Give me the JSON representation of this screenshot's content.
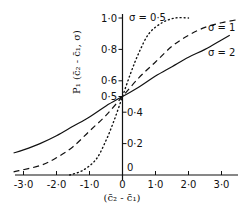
{
  "chart_data": {
    "type": "line",
    "title": "",
    "xlabel": "(c̄₂ - c̄₁)",
    "ylabel": "P₁ (c̄₂ - c̄₁, σ)",
    "xlim": [
      -3.3,
      3.5
    ],
    "ylim": [
      0,
      1.0
    ],
    "grid": false,
    "x_ticks": [
      {
        "value": -3.0,
        "label": "-3·0"
      },
      {
        "value": -2.0,
        "label": "-2·0"
      },
      {
        "value": -1.0,
        "label": "-1·0"
      },
      {
        "value": 0,
        "label": "0"
      },
      {
        "value": 1.0,
        "label": "1·0"
      },
      {
        "value": 2.0,
        "label": "2·0"
      },
      {
        "value": 3.0,
        "label": "3·0"
      }
    ],
    "y_ticks": [
      {
        "value": 0,
        "label": "0",
        "side": "right"
      },
      {
        "value": 0.2,
        "label": "0·2",
        "side": "right"
      },
      {
        "value": 0.4,
        "label": "0·4",
        "side": "right"
      },
      {
        "value": 0.5,
        "label": "0·5",
        "side": "left"
      },
      {
        "value": 0.6,
        "label": "0·6",
        "side": "left"
      },
      {
        "value": 0.8,
        "label": "0·8",
        "side": "left"
      },
      {
        "value": 1.0,
        "label": "1·0",
        "side": "left"
      }
    ],
    "series": [
      {
        "name": "σ = 0.5",
        "label": "σ = 0·5",
        "style": "dotted",
        "x": [
          -1.6,
          -1.2,
          -0.8,
          -0.5,
          -0.25,
          0,
          0.25,
          0.5,
          0.8,
          1.2,
          1.6,
          2.0
        ],
        "y": [
          0.0,
          0.03,
          0.1,
          0.22,
          0.35,
          0.5,
          0.65,
          0.78,
          0.9,
          0.97,
          1.0,
          1.0
        ]
      },
      {
        "name": "σ = 1",
        "label": "σ = 1",
        "style": "dashed",
        "x": [
          -3.3,
          -2.5,
          -2.0,
          -1.5,
          -1.0,
          -0.5,
          0,
          0.5,
          1.0,
          1.5,
          2.0,
          2.5,
          3.0,
          3.5
        ],
        "y": [
          0.02,
          0.06,
          0.11,
          0.18,
          0.28,
          0.38,
          0.5,
          0.62,
          0.72,
          0.82,
          0.89,
          0.94,
          0.97,
          0.99
        ]
      },
      {
        "name": "σ = 2",
        "label": "σ = 2",
        "style": "solid",
        "x": [
          -3.3,
          -3.0,
          -2.5,
          -2.0,
          -1.5,
          -1.0,
          -0.5,
          0,
          0.5,
          1.0,
          1.5,
          2.0,
          2.5,
          3.0,
          3.25
        ],
        "y": [
          0.14,
          0.16,
          0.2,
          0.25,
          0.31,
          0.37,
          0.44,
          0.5,
          0.56,
          0.63,
          0.69,
          0.75,
          0.8,
          0.86,
          0.89
        ]
      }
    ],
    "annotations": [
      {
        "text": "σ = 0·5",
        "near": "top of y-axis"
      },
      {
        "text": "σ = 1",
        "near": "dashed curve, upper right"
      },
      {
        "text": "σ = 2",
        "near": "solid curve, right"
      }
    ]
  }
}
